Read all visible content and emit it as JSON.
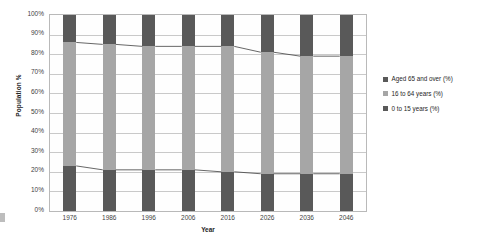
{
  "chart_data": {
    "type": "bar",
    "subtype": "100% stacked column with connector lines",
    "title": "",
    "xlabel": "Year",
    "ylabel": "Population %",
    "categories": [
      "1976",
      "1986",
      "1996",
      "2006",
      "2016",
      "2026",
      "2036",
      "2046"
    ],
    "ylim": [
      0,
      100
    ],
    "ytick_labels": [
      "0%",
      "10%",
      "20%",
      "30%",
      "40%",
      "50%",
      "60%",
      "70%",
      "80%",
      "90%",
      "100%"
    ],
    "ytick_values": [
      0,
      10,
      20,
      30,
      40,
      50,
      60,
      70,
      80,
      90,
      100
    ],
    "grid": true,
    "legend_position": "right",
    "series": [
      {
        "name": "Aged 65 and over (%)",
        "color": "#595959",
        "values": [
          14,
          15,
          16,
          16,
          16,
          19,
          21,
          21
        ]
      },
      {
        "name": "16 to 64 years (%)",
        "color": "#a6a6a6",
        "values": [
          63,
          64,
          63,
          63,
          64,
          62,
          60,
          60
        ]
      },
      {
        "name": "0 to 15 years (%)",
        "color": "#595959",
        "values": [
          23,
          21,
          21,
          21,
          20,
          19,
          19,
          19
        ]
      }
    ],
    "stack_boundaries_pct": {
      "top_of_mid": [
        86,
        85,
        84,
        84,
        84,
        81,
        79,
        79
      ],
      "top_of_bottom": [
        23,
        21,
        21,
        21,
        20,
        19,
        19,
        19
      ]
    }
  },
  "colors": {
    "dark": "#595959",
    "light": "#a6a6a6",
    "grid": "#c9c9c9",
    "border": "#b9b9b9",
    "text": "#262626"
  }
}
